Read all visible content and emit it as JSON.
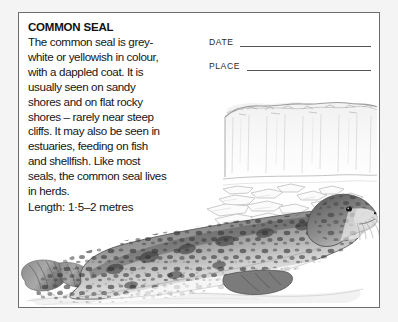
{
  "card": {
    "title": "COMMON SEAL",
    "body_lines": [
      "The common seal is grey-",
      "white or yellowish in colour,",
      "with a dappled coat. It is",
      "usually seen on sandy",
      "shores and on flat rocky",
      "shores – rarely near steep",
      "cliffs. It may also be seen in",
      "estuaries, feeding on fish",
      "and shellfish. Like most",
      "seals, the common seal lives",
      "in herds."
    ],
    "length_label": "Length: 1·5–2 metres",
    "fields": [
      {
        "label": "DATE",
        "value": ""
      },
      {
        "label": "PLACE",
        "value": ""
      }
    ],
    "illustration": {
      "caption": "common-seal-on-ice",
      "scene_elements": [
        "ice-cliff",
        "ice-floes",
        "common-seal"
      ]
    },
    "colors": {
      "page_background": "#f4f4f4",
      "card_background": "#ffffff",
      "card_border": "#6d6d6d",
      "text": "#151515",
      "rule": "#555555",
      "seal_dark": "#4a4a4a",
      "seal_mid": "#8e8e8e",
      "seal_light": "#d8d8d8",
      "ice_outline": "#b9b9b9"
    }
  }
}
